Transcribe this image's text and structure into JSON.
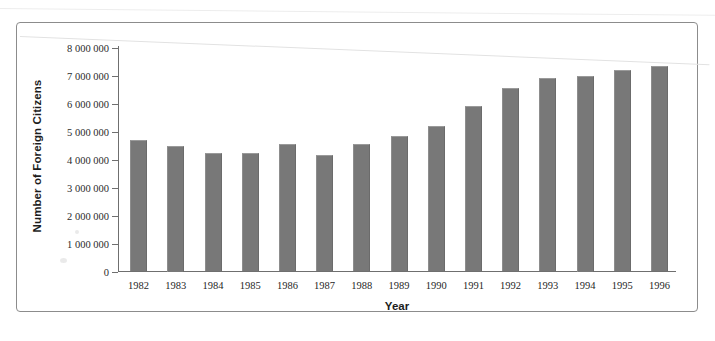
{
  "chart_data": {
    "type": "bar",
    "title": "",
    "xlabel": "Year",
    "ylabel": "Number of Foreign Citizens",
    "categories": [
      "1982",
      "1983",
      "1984",
      "1985",
      "1986",
      "1987",
      "1988",
      "1989",
      "1990",
      "1991",
      "1992",
      "1993",
      "1994",
      "1995",
      "1996"
    ],
    "values": [
      4700000,
      4500000,
      4220000,
      4220000,
      4550000,
      4150000,
      4550000,
      4830000,
      5200000,
      5900000,
      6550000,
      6900000,
      7000000,
      7200000,
      7350000
    ],
    "ylim": [
      0,
      8000000
    ],
    "ytick_labels": [
      "8 000 000",
      "7 000 000",
      "6 000 000",
      "5 000 000",
      "4 000 000",
      "3 000 000",
      "2 000 000",
      "1 000 000",
      "0"
    ],
    "ytick_values": [
      8000000,
      7000000,
      6000000,
      5000000,
      4000000,
      3000000,
      2000000,
      1000000,
      0
    ],
    "grid": false,
    "legend": false,
    "series_color": "#787878",
    "axis_color": "#6f6f6f",
    "frame_color": "#8c8c8c"
  }
}
